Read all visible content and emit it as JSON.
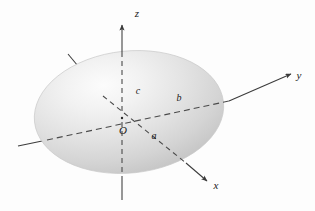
{
  "figure": {
    "type": "3d-geometry-diagram",
    "background_color": "#fdfdfd"
  },
  "axes": [
    {
      "id": "z",
      "label": "z",
      "label_x": 137,
      "label_y": 16,
      "direction": "up",
      "style": "dashed-inside-solid-outside",
      "color": "#3b3b3b"
    },
    {
      "id": "y",
      "label": "y",
      "label_x": 299,
      "label_y": 79,
      "direction": "upper-right",
      "style": "dashed-inside-solid-outside",
      "color": "#3b3b3b"
    },
    {
      "id": "x",
      "label": "x",
      "label_x": 216,
      "label_y": 188,
      "direction": "lower-right",
      "style": "dashed-inside-solid-outside",
      "color": "#3b3b3b"
    }
  ],
  "origin": {
    "label": "O",
    "label_x": 124,
    "label_y": 133,
    "point_x": 122,
    "point_y": 118
  },
  "semi_axes": [
    {
      "id": "a",
      "label": "a",
      "label_x": 153,
      "label_y": 138,
      "axis": "x",
      "note": "semi-axis along x"
    },
    {
      "id": "b",
      "label": "b",
      "label_x": 178,
      "label_y": 100,
      "axis": "y",
      "note": "semi-axis along y"
    },
    {
      "id": "c",
      "label": "c",
      "label_x": 137,
      "label_y": 93,
      "axis": "z",
      "note": "semi-axis along z"
    }
  ],
  "ellipsoid": {
    "center_x": 129,
    "center_y": 112,
    "radius_x": 95,
    "radius_y": 61,
    "rotation_deg": -6,
    "fill_light": "#fbfbfb",
    "fill_mid": "#dedede",
    "fill_dark": "#b9b9b9",
    "outline_color": "#c8c8c8"
  },
  "colors": {
    "line": "#3b3b3b",
    "dash": "#4a4a4a",
    "text": "#1a1a1a",
    "background": "#fdfdfd"
  }
}
